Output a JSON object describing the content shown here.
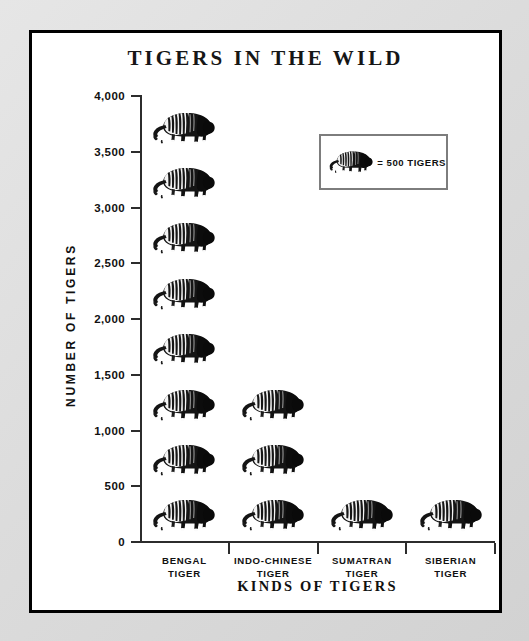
{
  "chart_data": {
    "type": "bar",
    "subtype": "pictograph",
    "title": "TIGERS IN THE WILD",
    "xlabel": "KINDS OF TIGERS",
    "ylabel": "NUMBER OF TIGERS",
    "categories": [
      "BENGAL TIGER",
      "INDO-CHINESE TIGER",
      "SUMATRAN TIGER",
      "SIBERIAN TIGER"
    ],
    "values": [
      4000,
      1500,
      500,
      500
    ],
    "icon_counts": [
      8,
      3,
      1,
      1
    ],
    "icon_unit_value": 500,
    "icon_name": "tiger-icon",
    "ylim": [
      0,
      4000
    ],
    "ytick_values": [
      0,
      500,
      1000,
      1500,
      2000,
      2500,
      3000,
      3500,
      4000
    ],
    "ytick_labels": [
      "0",
      "500",
      "1,000",
      "1,500",
      "2,000",
      "2,500",
      "3,000",
      "3,500",
      "4,000"
    ],
    "grid": false,
    "legend_position": "inside-top-right"
  },
  "title": "TIGERS IN THE WILD",
  "axes": {
    "y_title": "NUMBER OF TIGERS",
    "x_title": "KINDS OF TIGERS",
    "y_ticks": [
      "4,000",
      "3,500",
      "3,000",
      "2,500",
      "2,000",
      "1,500",
      "1,000",
      "500",
      "0"
    ]
  },
  "categories": [
    {
      "line1": "BENGAL",
      "line2": "TIGER",
      "icons": 8,
      "value": 4000
    },
    {
      "line1": "INDO-CHINESE",
      "line2": "TIGER",
      "icons": 3,
      "value": 1500
    },
    {
      "line1": "SUMATRAN",
      "line2": "TIGER",
      "icons": 1,
      "value": 500
    },
    {
      "line1": "SIBERIAN",
      "line2": "TIGER",
      "icons": 1,
      "value": 500
    }
  ],
  "legend": {
    "icon": "tiger-icon",
    "text": "= 500 TIGERS"
  },
  "colors": {
    "page_background": "#d9d9d9",
    "card_background": "#ffffff",
    "card_border": "#000000",
    "axis": "#2c2c2c",
    "text": "#111111",
    "legend_border": "#7d7d7d",
    "tiger_dark": "#141414",
    "tiger_light": "#fafafa"
  }
}
